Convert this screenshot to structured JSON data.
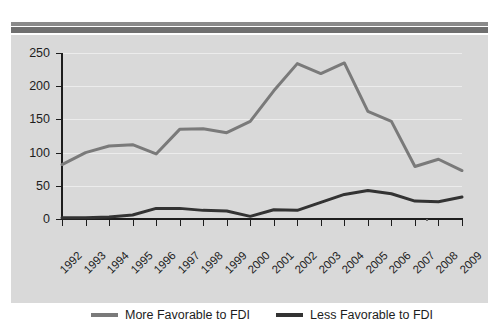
{
  "panel": {
    "background_color": "#d9d9d9",
    "topbar_outer_color": "#8a8a8a",
    "topbar_inner_color": "#6f6f6f"
  },
  "legend": {
    "position": "bottom-center",
    "entries": [
      {
        "label": "More Favorable to FDI",
        "color": "#7a7a7a"
      },
      {
        "label": "Less Favorable to FDI",
        "color": "#333333"
      }
    ]
  },
  "chart_data": {
    "type": "line",
    "title": "",
    "subtitle": "",
    "xlabel": "",
    "ylabel": "",
    "grid": true,
    "legend_position": "bottom-center",
    "ylim": [
      0,
      250
    ],
    "yticks": [
      0,
      50,
      100,
      150,
      200,
      250
    ],
    "ytick_labels": [
      "0",
      "50",
      "100",
      "150",
      "200",
      "250"
    ],
    "categories": [
      "1992",
      "1993",
      "1994",
      "1995",
      "1996",
      "1997",
      "1998",
      "1999",
      "2000",
      "2001",
      "2002",
      "2003",
      "2004",
      "2005",
      "2006",
      "2007",
      "2008",
      "2009"
    ],
    "series": [
      {
        "name": "More Favorable to FDI",
        "color": "#7a7a7a",
        "values": [
          82,
          100,
          110,
          112,
          98,
          135,
          136,
          130,
          147,
          193,
          234,
          219,
          235,
          162,
          147,
          79,
          90,
          73
        ]
      },
      {
        "name": "Less Favorable to FDI",
        "color": "#333333",
        "values": [
          2,
          2,
          3,
          6,
          16,
          16,
          13,
          12,
          4,
          14,
          13,
          25,
          37,
          43,
          38,
          27,
          26,
          33
        ]
      }
    ]
  }
}
